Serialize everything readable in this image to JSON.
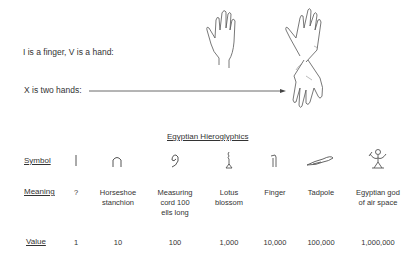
{
  "intro": {
    "roman_line_1": "I is a finger, V is a hand:",
    "roman_line_2": "X is two hands:"
  },
  "table": {
    "title": "Egyptian  Hieroglyphics",
    "row_labels": {
      "symbol": "Symbol",
      "meaning": "Meaning",
      "value": "Value"
    },
    "columns": [
      {
        "symbol_icon": "stroke-icon",
        "meaning": "?",
        "value": "1"
      },
      {
        "symbol_icon": "horseshoe-icon",
        "meaning": "Horseshoe\nstanchion",
        "value": "10"
      },
      {
        "symbol_icon": "coil-rope-icon",
        "meaning": "Measuring\ncord 100\nells long",
        "value": "100"
      },
      {
        "symbol_icon": "lotus-icon",
        "meaning": "Lotus\nblossom",
        "value": "1,000"
      },
      {
        "symbol_icon": "finger-icon",
        "meaning": "Finger",
        "value": "10,000"
      },
      {
        "symbol_icon": "tadpole-icon",
        "meaning": "Tadpole",
        "value": "100,000"
      },
      {
        "symbol_icon": "god-icon",
        "meaning": "Egyptian god\nof air space",
        "value": "1,000,000"
      }
    ]
  }
}
